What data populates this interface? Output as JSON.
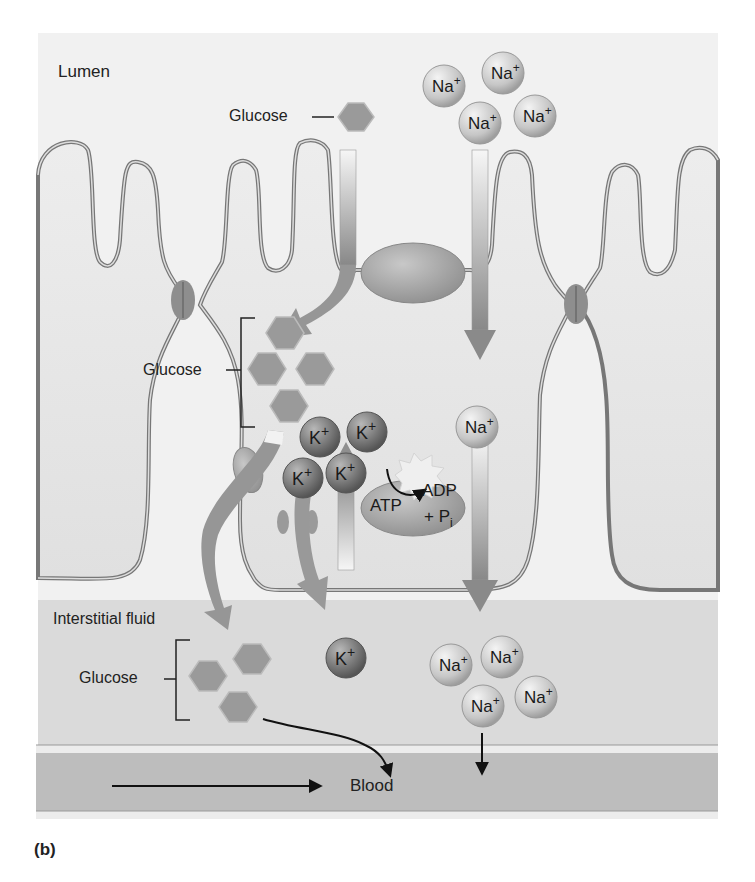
{
  "figure": {
    "panel_label": "(b)",
    "regions": {
      "lumen": "Lumen",
      "interstitial": "Interstitial fluid",
      "blood": "Blood"
    },
    "glucose_labels": {
      "lumen": "Glucose",
      "cell": "Glucose",
      "interstitial": "Glucose"
    },
    "ions": {
      "na": "Na",
      "k": "K",
      "charge": "+"
    },
    "pump": {
      "atp": "ATP",
      "adp": "ADP",
      "pi": "+ P",
      "pi_sub": "i"
    },
    "colors": {
      "background_lumen": "#f2f2f2",
      "cell_fill": "#e6e6e6",
      "interstitial": "#d9d9d9",
      "blood_vessel": "#bfbfbf",
      "membrane": "#777777",
      "glucose_hex": "#9a9a9a",
      "na_ion": "#cfcfcf",
      "k_ion": "#7d7d7d",
      "arrow": "#8c8c8c"
    }
  }
}
